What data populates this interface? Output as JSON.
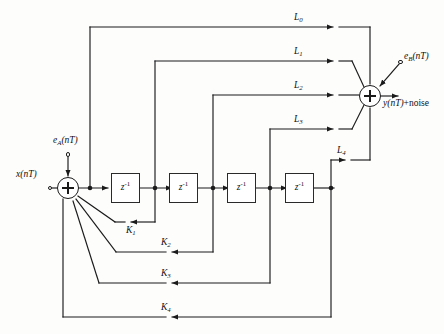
{
  "figure": {
    "type": "signal-flow-block-diagram"
  },
  "inputs": {
    "signal_label": "x(nT)",
    "noise_a_label": "e",
    "noise_a_sub": "A",
    "noise_a_arg": "(nT)",
    "noise_b_label": "e",
    "noise_b_sub": "B",
    "noise_b_arg": "(nT)"
  },
  "output": {
    "label": "y(nT)",
    "suffix": "+noise"
  },
  "delays": [
    {
      "id": "delay-1",
      "label": "z",
      "exponent": "-1"
    },
    {
      "id": "delay-2",
      "label": "z",
      "exponent": "-1"
    },
    {
      "id": "delay-3",
      "label": "z",
      "exponent": "-1"
    },
    {
      "id": "delay-4",
      "label": "z",
      "exponent": "-1"
    }
  ],
  "feedforward_coefficients": [
    {
      "id": "L0",
      "letter": "L",
      "index": "0"
    },
    {
      "id": "L1",
      "letter": "L",
      "index": "1"
    },
    {
      "id": "L2",
      "letter": "L",
      "index": "2"
    },
    {
      "id": "L3",
      "letter": "L",
      "index": "3"
    },
    {
      "id": "L4",
      "letter": "L",
      "index": "4"
    }
  ],
  "feedback_coefficients": [
    {
      "id": "K1",
      "letter": "K",
      "index": "1"
    },
    {
      "id": "K2",
      "letter": "K",
      "index": "2"
    },
    {
      "id": "K3",
      "letter": "K",
      "index": "3"
    },
    {
      "id": "K4",
      "letter": "K",
      "index": "4"
    }
  ],
  "adders": [
    {
      "id": "input-adder",
      "symbol": "+"
    },
    {
      "id": "output-adder",
      "symbol": "+"
    }
  ],
  "colors": {
    "line": "#1a1a1a",
    "box_border": "#2a2a2a",
    "background": "#fdfdfc",
    "text": "#111111"
  }
}
